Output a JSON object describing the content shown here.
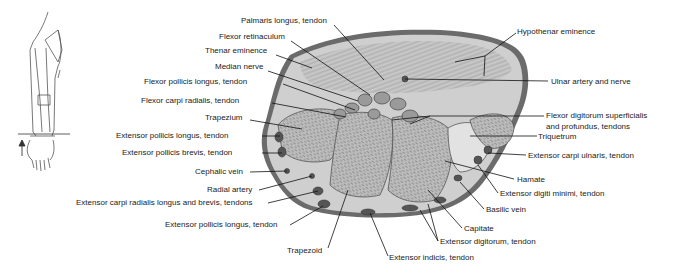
{
  "figure": {
    "orientation_icon": "arm-with-section-plane-icon",
    "labels_left": [
      {
        "id": "palmaris-longus",
        "text": "Palmaris longus, tendon",
        "x": 241,
        "y": 20
      },
      {
        "id": "flexor-retinaculum",
        "text": "Flexor retinaculum",
        "x": 219,
        "y": 36
      },
      {
        "id": "thenar-eminence",
        "text": "Thenar eminence",
        "x": 205,
        "y": 50
      },
      {
        "id": "median-nerve",
        "text": "Median nerve",
        "x": 215,
        "y": 66
      },
      {
        "id": "flexor-pollicis-longus",
        "text": "Flexor pollicis longus, tendon",
        "x": 144,
        "y": 79
      },
      {
        "id": "flexor-carpi-radialis",
        "text": "Flexor carpi radialis, tendon",
        "x": 141,
        "y": 98
      },
      {
        "id": "trapezium",
        "text": "Trapezium",
        "x": 205,
        "y": 115
      },
      {
        "id": "extensor-pollicis-longus-1",
        "text": "Extensor pollicis longus, tendon",
        "x": 116,
        "y": 131
      },
      {
        "id": "extensor-pollicis-brevis",
        "text": "Extensor pollicis brevis, tendon",
        "x": 122,
        "y": 148
      },
      {
        "id": "cephalic-vein",
        "text": "Cephalic vein",
        "x": 195,
        "y": 167
      },
      {
        "id": "radial-artery",
        "text": "Radial artery",
        "x": 207,
        "y": 185
      },
      {
        "id": "extensor-carpi-radialis",
        "text": "Extensor carpi radialis longus and brevis, tendons",
        "x": 76,
        "y": 198
      },
      {
        "id": "extensor-pollicis-longus-2",
        "text": "Extensor pollicis longus, tendon",
        "x": 165,
        "y": 220
      },
      {
        "id": "trapezoid",
        "text": "Trapezoid",
        "x": 287,
        "y": 248
      }
    ],
    "labels_right": [
      {
        "id": "hypothenar-eminence",
        "text": "Hypothenar eminence",
        "x": 517,
        "y": 27
      },
      {
        "id": "ulnar-artery-nerve",
        "text": "Ulnar artery and nerve",
        "x": 551,
        "y": 77
      },
      {
        "id": "flexor-digitorum-1",
        "text": "Flexor digitorum superficialis",
        "x": 546,
        "y": 111
      },
      {
        "id": "flexor-digitorum-2",
        "text": "and profundus, tendons",
        "x": 546,
        "y": 122
      },
      {
        "id": "triquetrum",
        "text": "Triquetrum",
        "x": 538,
        "y": 132
      },
      {
        "id": "extensor-carpi-ulnaris",
        "text": "Extensor carpi ulnaris, tendon",
        "x": 528,
        "y": 151
      },
      {
        "id": "hamate",
        "text": "Hamate",
        "x": 517,
        "y": 175
      },
      {
        "id": "extensor-digiti-minimi",
        "text": "Extensor digiti minimi, tendon",
        "x": 500,
        "y": 189
      },
      {
        "id": "basilic-vein",
        "text": "Basilic vein",
        "x": 486,
        "y": 205
      },
      {
        "id": "capitate",
        "text": "Capitate",
        "x": 464,
        "y": 224
      },
      {
        "id": "extensor-digitorum",
        "text": "Extensor digitorum, tendon",
        "x": 440,
        "y": 237
      },
      {
        "id": "extensor-indicis",
        "text": "Extensor indicis, tendon",
        "x": 389,
        "y": 253
      }
    ],
    "colors": {
      "background": "#ffffff",
      "text": "#222222",
      "leader_line": "#111111",
      "tissue_dark": "#5a5a5a",
      "tissue_mid": "#a8a8a8",
      "tissue_light": "#d4d4d4",
      "bone": "#b8b8b8"
    }
  }
}
